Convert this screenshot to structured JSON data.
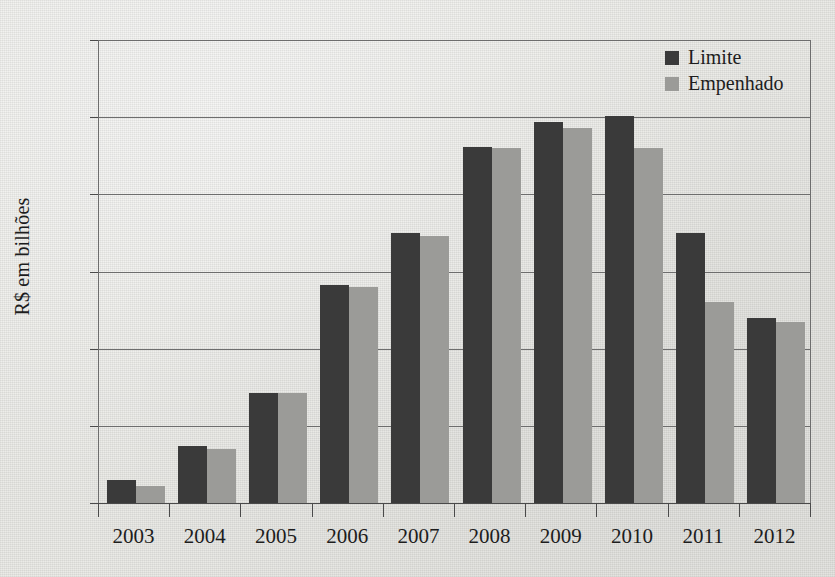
{
  "chart_data": {
    "type": "bar",
    "title": "",
    "subtitle": "",
    "xlabel": "",
    "ylabel": "R$ em bilhões",
    "categories": [
      "2003",
      "2004",
      "2005",
      "2006",
      "2007",
      "2008",
      "2009",
      "2010",
      "2011",
      "2012"
    ],
    "series": [
      {
        "name": "Limite",
        "color": "#3a3a3a",
        "values": [
          0.15,
          0.37,
          0.71,
          1.41,
          1.75,
          2.31,
          2.47,
          2.51,
          1.75,
          1.2
        ]
      },
      {
        "name": "Empenhado",
        "color": "#9b9b98",
        "values": [
          0.11,
          0.35,
          0.71,
          1.4,
          1.73,
          2.3,
          2.43,
          2.3,
          1.3,
          1.17
        ]
      }
    ],
    "ylim": [
      0,
      3
    ],
    "yticks": [
      0,
      0.5,
      1,
      1.5,
      2,
      2.5,
      3
    ],
    "ytick_labels": [
      "0",
      "0,5",
      "1",
      "1,5",
      "2",
      "2,5",
      "3"
    ],
    "grid": "horizontal",
    "legend_position": "top-right"
  },
  "legend": {
    "items": [
      {
        "label": "Limite",
        "color": "#3a3a3a"
      },
      {
        "label": "Empenhado",
        "color": "#9b9b98"
      }
    ]
  },
  "colors": {
    "series_dark": "#3a3a3a",
    "series_light": "#9b9b98",
    "background": "#e9e9e5",
    "axis": "#4a4a4a",
    "grid": "#6d6d6d",
    "text": "#1d1d1d"
  }
}
